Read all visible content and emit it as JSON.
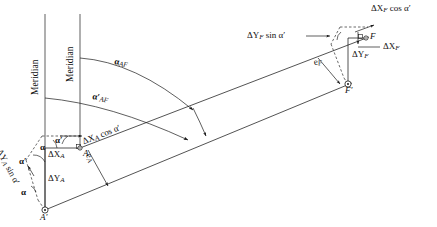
{
  "figure": {
    "type": "surveying-traverse-diagram",
    "width": 437,
    "height": 227,
    "background_color": "#ffffff",
    "line_color": "#1a1a1a",
    "text_color": "#111111"
  },
  "labels": {
    "meridian_left": "Meridian",
    "meridian_right": "Meridian",
    "alpha_AF": "α",
    "alpha_AF_sub": "AF",
    "alpha_AF_prime": "α′",
    "alpha_AF_prime_sub": "AF",
    "alpha_a_prime": "α′",
    "alpha_a": "α",
    "alpha_a2": "α′",
    "alpha_a3": "α",
    "delta_XA": "ΔX",
    "delta_XA_sub": "A",
    "delta_YA": "ΔY",
    "delta_YA_sub": "A",
    "delta_XA_cos": "ΔX",
    "delta_XA_cos_sub": "A",
    "delta_XA_cos_rest": " cos α′",
    "delta_YA_sin": "ΔY",
    "delta_YA_sin_sub": "A",
    "delta_YA_sin_rest": " sin α′",
    "point_A": "A",
    "point_A_prime": "A′",
    "e_A": "e",
    "e_A_sub": "A",
    "delta_XF": "ΔX",
    "delta_XF_sub": "F",
    "delta_YF": "ΔY",
    "delta_YF_sub": "F",
    "delta_XF_cos": "ΔX",
    "delta_XF_cos_sub": "F",
    "delta_XF_cos_rest": " cos α′",
    "delta_YF_sin": "ΔY",
    "delta_YF_sin_sub": "F",
    "delta_YF_sin_rest": " sin α′",
    "point_F": "F",
    "point_F_prime": "F′",
    "e_F": "e",
    "e_F_sub": "F"
  },
  "geometry": {
    "meridian_left_x": 45,
    "meridian_right_x": 80,
    "meridian_top_y": 14,
    "meridian_bottom_y": 210,
    "point_A": {
      "x": 80,
      "y": 148
    },
    "point_A_prime": {
      "x": 45,
      "y": 210
    },
    "point_F": {
      "x": 366,
      "y": 38
    },
    "point_F_prime": {
      "x": 348,
      "y": 84
    },
    "corner_A_left": {
      "x": 45,
      "y": 148
    },
    "corner_F_bottom": {
      "x": 348,
      "y": 38
    }
  }
}
